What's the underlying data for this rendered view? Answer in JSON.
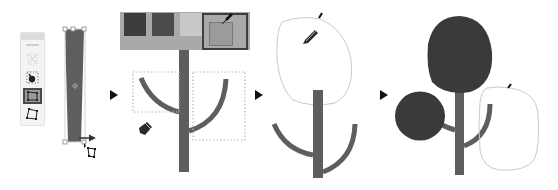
{
  "diagram": {
    "steps": [
      {
        "index": 1,
        "description": "Select trunk rectangle and taper with Free Transform / Distort tool"
      },
      {
        "index": 2,
        "description": "Pick color from swatches and draw curved branches with Pen tool"
      },
      {
        "index": 3,
        "description": "Draw foliage outline with Pencil tool"
      },
      {
        "index": 4,
        "description": "Fill foliage shapes with dark color and add more"
      }
    ],
    "step_arrows": [
      "arrow-1-2",
      "arrow-2-3",
      "arrow-3-4"
    ]
  },
  "toolpanel": {
    "tools": [
      {
        "name": "free-transform",
        "active": false
      },
      {
        "name": "puppet-warp",
        "active": false
      },
      {
        "name": "perspective-distort",
        "active": true
      },
      {
        "name": "free-distort",
        "active": false
      }
    ]
  },
  "swatches": {
    "colors": [
      "#3c3c3c",
      "#4a4a4a",
      "#c8c8c8",
      "#9b9b9b"
    ],
    "selected_index": 3,
    "bar_color": "#a9a9a9"
  },
  "colors": {
    "trunk": "#5e5e5e",
    "foliage": "#3a3a3a",
    "outline": "#c9c9c9",
    "selection": "#b8b8b8",
    "arrow": "#111111"
  }
}
